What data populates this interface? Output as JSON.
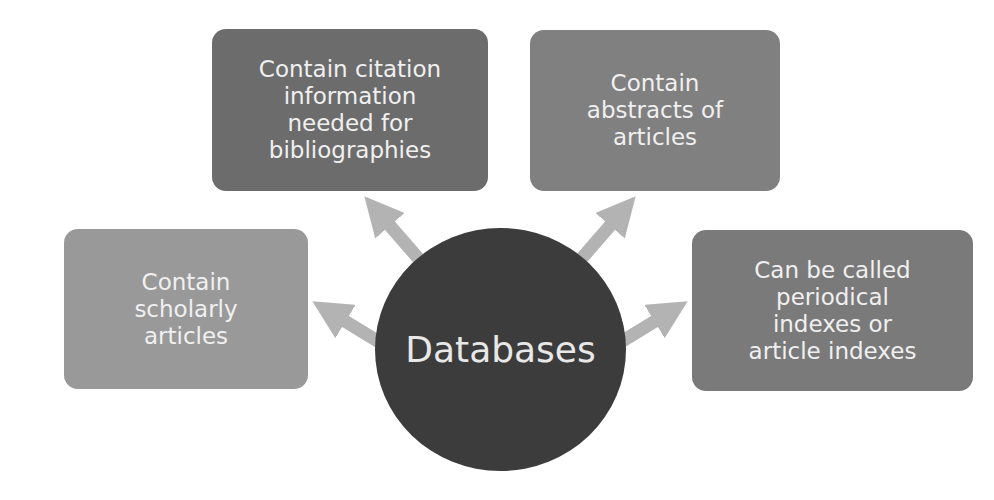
{
  "diagram": {
    "type": "radial-hub",
    "center": {
      "label": "Databases",
      "color": "#3c3c3c"
    },
    "nodes": [
      {
        "id": "top-left",
        "label": "Contain citation\ninformation\nneeded for\nbibliographies",
        "color": "#6c6c6c"
      },
      {
        "id": "top-right",
        "label": "Contain\nabstracts of\narticles",
        "color": "#808080"
      },
      {
        "id": "left",
        "label": "Contain\nscholarly\narticles",
        "color": "#999999"
      },
      {
        "id": "right",
        "label": "Can be called\nperiodical\nindexes or\narticle indexes",
        "color": "#7a7a7a"
      }
    ],
    "arrow_color": "#b3b3b3"
  }
}
